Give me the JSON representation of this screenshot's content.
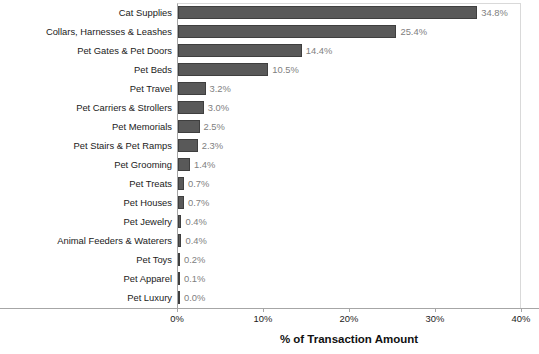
{
  "chart_data": {
    "type": "bar",
    "orientation": "horizontal",
    "title": "",
    "xlabel": "% of Transaction Amount",
    "ylabel": "",
    "xlim": [
      0,
      40
    ],
    "xticks": [
      "0%",
      "10%",
      "20%",
      "30%",
      "40%"
    ],
    "xtick_values": [
      0,
      10,
      20,
      30,
      40
    ],
    "grid": false,
    "legend": null,
    "bar_color": "#595959",
    "value_label_color": "#808080",
    "categories": [
      "Cat Supplies",
      "Collars, Harnesses & Leashes",
      "Pet Gates & Pet Doors",
      "Pet Beds",
      "Pet Travel",
      "Pet Carriers & Strollers",
      "Pet Memorials",
      "Pet Stairs & Pet Ramps",
      "Pet Grooming",
      "Pet Treats",
      "Pet Houses",
      "Pet Jewelry",
      "Animal Feeders & Waterers",
      "Pet Toys",
      "Pet Apparel",
      "Pet Luxury"
    ],
    "values": [
      34.8,
      25.4,
      14.4,
      10.5,
      3.2,
      3.0,
      2.5,
      2.3,
      1.4,
      0.7,
      0.7,
      0.4,
      0.4,
      0.2,
      0.1,
      0.0
    ],
    "value_labels": [
      "34.8%",
      "25.4%",
      "14.4%",
      "10.5%",
      "3.2%",
      "3.0%",
      "2.5%",
      "2.3%",
      "1.4%",
      "0.7%",
      "0.7%",
      "0.4%",
      "0.4%",
      "0.2%",
      "0.1%",
      "0.0%"
    ]
  }
}
